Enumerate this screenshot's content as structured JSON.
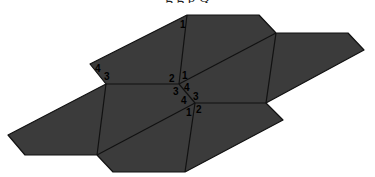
{
  "figure": {
    "caption_fragment": "g g p Q",
    "fill_color": "#3b3b3b",
    "line_color": "#111111",
    "outline": [
      [
        90,
        64
      ],
      [
        187,
        15
      ],
      [
        259,
        15
      ],
      [
        276,
        33
      ],
      [
        348,
        33
      ],
      [
        364,
        50
      ],
      [
        266,
        103
      ],
      [
        283,
        120
      ],
      [
        185,
        172
      ],
      [
        113,
        172
      ],
      [
        97,
        155
      ],
      [
        25,
        155
      ],
      [
        8,
        135
      ],
      [
        106,
        84
      ]
    ],
    "inner_edges": [
      [
        [
          187,
          15
        ],
        [
          179,
          84
        ]
      ],
      [
        [
          179,
          84
        ],
        [
          276,
          33
        ]
      ],
      [
        [
          276,
          33
        ],
        [
          266,
          103
        ]
      ],
      [
        [
          106,
          84
        ],
        [
          179,
          84
        ]
      ],
      [
        [
          179,
          84
        ],
        [
          195,
          103
        ]
      ],
      [
        [
          195,
          103
        ],
        [
          266,
          103
        ]
      ],
      [
        [
          106,
          84
        ],
        [
          97,
          155
        ]
      ],
      [
        [
          97,
          155
        ],
        [
          195,
          103
        ]
      ],
      [
        [
          195,
          103
        ],
        [
          185,
          172
        ]
      ]
    ],
    "labels": [
      {
        "text": "1",
        "x": 180,
        "y": 28
      },
      {
        "text": "4",
        "x": 95,
        "y": 72
      },
      {
        "text": "3",
        "x": 104,
        "y": 80
      },
      {
        "text": "2",
        "x": 169,
        "y": 82
      },
      {
        "text": "1",
        "x": 182,
        "y": 79
      },
      {
        "text": "4",
        "x": 184,
        "y": 91
      },
      {
        "text": "3",
        "x": 173,
        "y": 95
      },
      {
        "text": "4",
        "x": 181,
        "y": 104
      },
      {
        "text": "3",
        "x": 193,
        "y": 100
      },
      {
        "text": "1",
        "x": 186,
        "y": 116
      },
      {
        "text": "2",
        "x": 196,
        "y": 113
      }
    ]
  }
}
